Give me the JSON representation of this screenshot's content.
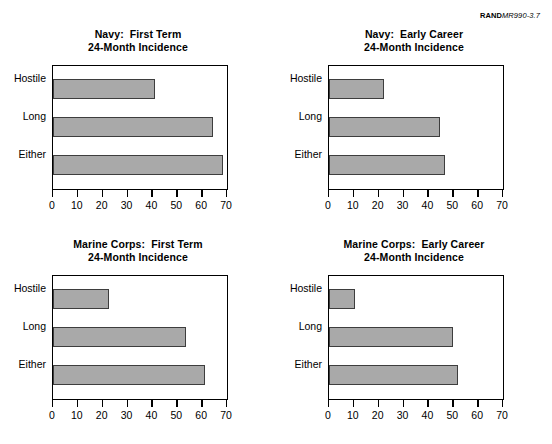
{
  "source": {
    "mark": "RAND",
    "document": "MR990-3.7"
  },
  "chart_data": [
    {
      "type": "bar",
      "orientation": "horizontal",
      "title": "Navy:  First Term",
      "subtitle": "24-Month Incidence",
      "categories": [
        "Hostile",
        "Long",
        "Either"
      ],
      "values": [
        41,
        64.5,
        68.5
      ],
      "xlabel": "",
      "ylabel": "",
      "xlim": [
        0,
        70
      ],
      "xticks": [
        0,
        10,
        20,
        30,
        40,
        50,
        60,
        70
      ],
      "grid": false,
      "legend": false,
      "bar_color": "#a9a9a9",
      "bar_edge_color": "#3d3d3d"
    },
    {
      "type": "bar",
      "orientation": "horizontal",
      "title": "Navy:  Early Career",
      "subtitle": "24-Month Incidence",
      "categories": [
        "Hostile",
        "Long",
        "Either"
      ],
      "values": [
        22,
        44.5,
        46.5
      ],
      "xlabel": "",
      "ylabel": "",
      "xlim": [
        0,
        70
      ],
      "xticks": [
        0,
        10,
        20,
        30,
        40,
        50,
        60,
        70
      ],
      "grid": false,
      "legend": false,
      "bar_color": "#a9a9a9",
      "bar_edge_color": "#3d3d3d"
    },
    {
      "type": "bar",
      "orientation": "horizontal",
      "title": "Marine Corps:  First Term",
      "subtitle": "24-Month Incidence",
      "categories": [
        "Hostile",
        "Long",
        "Either"
      ],
      "values": [
        22.5,
        53.5,
        61
      ],
      "xlabel": "",
      "ylabel": "",
      "xlim": [
        0,
        70
      ],
      "xticks": [
        0,
        10,
        20,
        30,
        40,
        50,
        60,
        70
      ],
      "grid": false,
      "legend": false,
      "bar_color": "#a9a9a9",
      "bar_edge_color": "#3d3d3d"
    },
    {
      "type": "bar",
      "orientation": "horizontal",
      "title": "Marine Corps:  Early Career",
      "subtitle": "24-Month Incidence",
      "categories": [
        "Hostile",
        "Long",
        "Either"
      ],
      "values": [
        10.5,
        50,
        52
      ],
      "xlabel": "",
      "ylabel": "",
      "xlim": [
        0,
        70
      ],
      "xticks": [
        0,
        10,
        20,
        30,
        40,
        50,
        60,
        70
      ],
      "grid": false,
      "legend": false,
      "bar_color": "#a9a9a9",
      "bar_edge_color": "#3d3d3d"
    }
  ]
}
